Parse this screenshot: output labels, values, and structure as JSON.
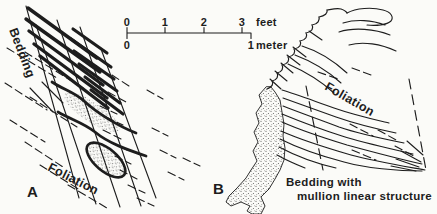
{
  "figure": {
    "colors": {
      "ink": "#1d1d1d",
      "paper": "#fbfbf8"
    },
    "scale_bar": {
      "feet_ticks": [
        "0",
        "1",
        "2",
        "3"
      ],
      "feet_unit": "feet",
      "meter_ticks": [
        "0",
        "1"
      ],
      "meter_unit": "meter"
    },
    "panel_a": {
      "label": "A",
      "bedding_label": "Bedding",
      "foliation_label": "Foliation"
    },
    "panel_b": {
      "label": "B",
      "foliation_label": "Foliation",
      "caption_line1": "Bedding with",
      "caption_line2": "mullion linear structure"
    }
  }
}
